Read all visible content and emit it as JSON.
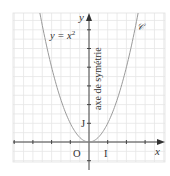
{
  "chart_data": {
    "type": "line",
    "title": "",
    "xlabel": "x",
    "ylabel": "y",
    "xlim": [
      -2.5,
      4.0
    ],
    "ylim": [
      -1.0,
      6.9
    ],
    "grid": true,
    "grid_minor_step": 0.5,
    "series": [
      {
        "name": "𝒞",
        "equation": "y = x^2",
        "x": [
          -2.6,
          -2.5,
          -2,
          -1.5,
          -1,
          -0.5,
          0,
          0.5,
          1,
          1.5,
          2,
          2.5,
          2.6
        ],
        "values": [
          6.76,
          6.25,
          4,
          2.25,
          1,
          0.25,
          0,
          0.25,
          1,
          2.25,
          4,
          6.25,
          6.76
        ]
      }
    ],
    "annotations": [
      {
        "text": "y = x²",
        "role": "curve-equation"
      },
      {
        "text": "𝒞",
        "role": "curve-name"
      },
      {
        "text": "axe de symétrie",
        "role": "y-axis-label-vertical"
      },
      {
        "text": "O",
        "role": "origin"
      },
      {
        "text": "I",
        "role": "x-unit"
      },
      {
        "text": "J",
        "role": "y-unit"
      }
    ],
    "legend": "none"
  },
  "labels": {
    "x_axis": "x",
    "y_axis": "y",
    "equation_lhs": "y = x",
    "equation_exp": "2",
    "curve_name": "𝒞",
    "symmetry_axis": "axe de symétrie",
    "origin": "O",
    "unit_i": "I",
    "unit_j": "J"
  },
  "colors": {
    "grid": "#e4e4e4",
    "axis": "#444444",
    "curve": "#9a9a9a",
    "text": "#333333"
  }
}
